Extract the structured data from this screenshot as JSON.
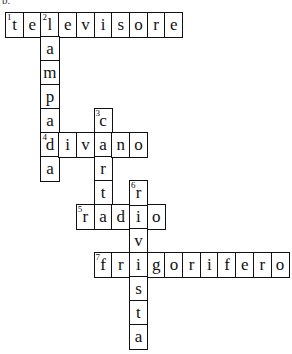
{
  "label": "b.",
  "grid": {
    "origin_x": 5,
    "origin_y": 12,
    "cell_w": 17.7,
    "cell_h": 24,
    "border_color": "#111111"
  },
  "words": [
    {
      "number": "1",
      "direction": "across",
      "answer": "televisore",
      "row": 0,
      "col": 0
    },
    {
      "number": "2",
      "direction": "down",
      "answer": "lampada",
      "row": 0,
      "col": 2
    },
    {
      "number": "3",
      "direction": "down",
      "answer": "carta",
      "row": 4,
      "col": 5
    },
    {
      "number": "4",
      "direction": "across",
      "answer": "divano",
      "row": 5,
      "col": 2
    },
    {
      "number": "5",
      "direction": "across",
      "answer": "radio",
      "row": 8,
      "col": 4
    },
    {
      "number": "6",
      "direction": "down",
      "answer": "rivista",
      "row": 7,
      "col": 7
    },
    {
      "number": "7",
      "direction": "across",
      "answer": "frigorifero",
      "row": 10,
      "col": 5
    }
  ]
}
